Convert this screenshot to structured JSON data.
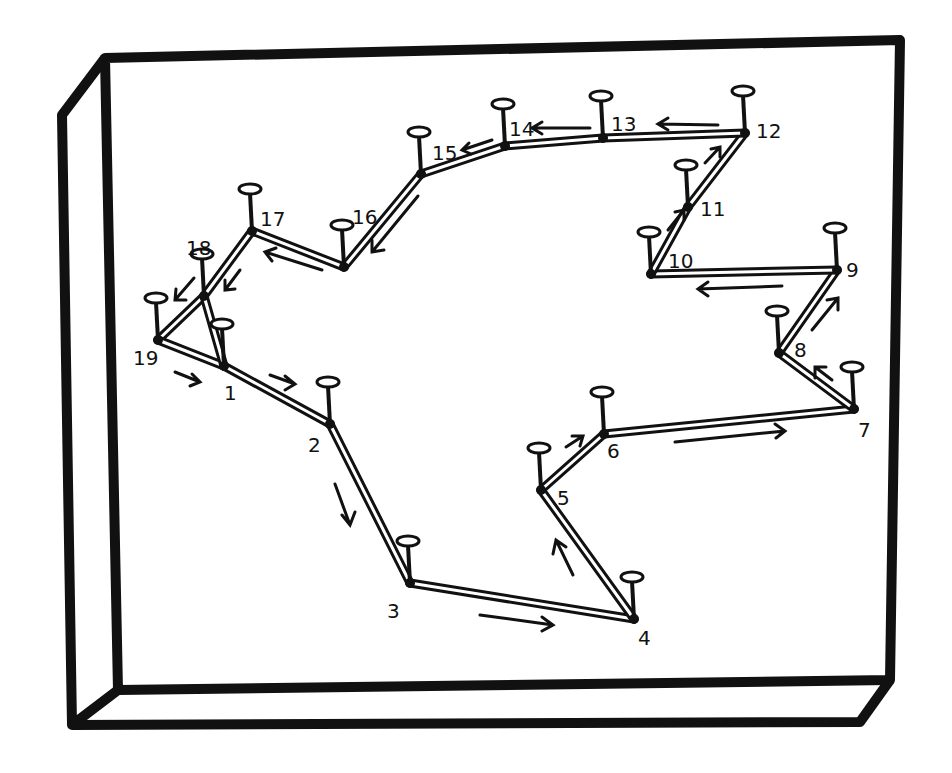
{
  "diagram": {
    "type": "nail-and-string board sketch",
    "colors": {
      "ink": "#111111",
      "paper": "#ffffff"
    },
    "nails": [
      {
        "id": "1",
        "x": 224,
        "y": 366,
        "lx": 224,
        "ly": 400
      },
      {
        "id": "2",
        "x": 330,
        "y": 424,
        "lx": 308,
        "ly": 452
      },
      {
        "id": "3",
        "x": 410,
        "y": 583,
        "lx": 387,
        "ly": 618
      },
      {
        "id": "4",
        "x": 634,
        "y": 619,
        "lx": 638,
        "ly": 645
      },
      {
        "id": "5",
        "x": 541,
        "y": 490,
        "lx": 557,
        "ly": 505
      },
      {
        "id": "6",
        "x": 604,
        "y": 434,
        "lx": 607,
        "ly": 458
      },
      {
        "id": "7",
        "x": 854,
        "y": 409,
        "lx": 858,
        "ly": 437
      },
      {
        "id": "8",
        "x": 779,
        "y": 353,
        "lx": 794,
        "ly": 357
      },
      {
        "id": "9",
        "x": 837,
        "y": 270,
        "lx": 846,
        "ly": 277
      },
      {
        "id": "10",
        "x": 651,
        "y": 274,
        "lx": 668,
        "ly": 268
      },
      {
        "id": "11",
        "x": 688,
        "y": 207,
        "lx": 700,
        "ly": 216
      },
      {
        "id": "12",
        "x": 745,
        "y": 133,
        "lx": 756,
        "ly": 138
      },
      {
        "id": "13",
        "x": 603,
        "y": 138,
        "lx": 611,
        "ly": 131
      },
      {
        "id": "14",
        "x": 505,
        "y": 146,
        "lx": 509,
        "ly": 136
      },
      {
        "id": "15",
        "x": 421,
        "y": 174,
        "lx": 432,
        "ly": 160
      },
      {
        "id": "16",
        "x": 344,
        "y": 267,
        "lx": 352,
        "ly": 224
      },
      {
        "id": "17",
        "x": 252,
        "y": 231,
        "lx": 260,
        "ly": 226
      },
      {
        "id": "18",
        "x": 204,
        "y": 296,
        "lx": 186,
        "ly": 255
      },
      {
        "id": "19",
        "x": 158,
        "y": 340,
        "lx": 133,
        "ly": 365
      }
    ],
    "path_order": [
      "1",
      "2",
      "3",
      "4",
      "5",
      "6",
      "7",
      "8",
      "9",
      "10",
      "11",
      "12",
      "13",
      "14",
      "15",
      "16",
      "17",
      "18",
      "19",
      "1"
    ],
    "extra_edges": [
      [
        "18",
        "1"
      ]
    ]
  }
}
